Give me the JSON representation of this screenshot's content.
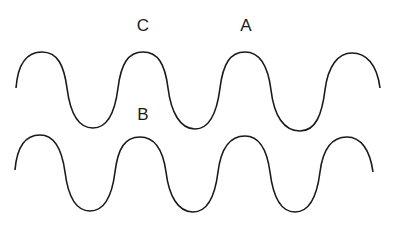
{
  "diagram": {
    "type": "two parallel sine waves with labeled points",
    "stroke_color": "#1a1a1a",
    "background": "#ffffff",
    "labels": [
      {
        "id": "C",
        "text": "C",
        "x": 143,
        "y": 17,
        "position": "above second crest of top wave"
      },
      {
        "id": "A",
        "text": "A",
        "x": 246,
        "y": 17,
        "position": "above third crest of top wave"
      },
      {
        "id": "B",
        "text": "B",
        "x": 143,
        "y": 106,
        "position": "between top wave and second crest of bottom wave"
      }
    ],
    "waves": [
      {
        "id": "top-wave",
        "peaks_x": [
          42,
          143,
          245,
          352
        ],
        "troughs_x": [
          93,
          195,
          300
        ],
        "peak_y": 52,
        "trough_y": 128
      },
      {
        "id": "bottom-wave",
        "peaks_x": [
          40,
          140,
          245,
          347
        ],
        "troughs_x": [
          90,
          193,
          295
        ],
        "peak_y": 136,
        "trough_y": 212
      }
    ]
  }
}
